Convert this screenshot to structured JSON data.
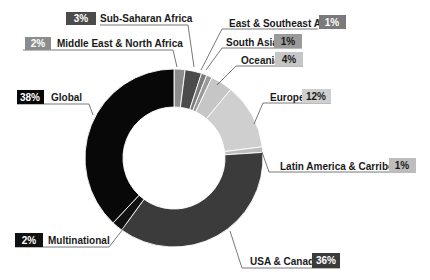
{
  "chart_data": {
    "type": "pie",
    "variant": "donut",
    "title": "",
    "start_angle": "12 o'clock, clockwise",
    "categories": [
      "Middle East & North Africa",
      "Sub-Saharan Africa",
      "East & Southeast Asia",
      "South Asia",
      "Oceania",
      "Europe",
      "Latin America & Carribean",
      "USA & Canada",
      "Multinational",
      "Global"
    ],
    "values": [
      2,
      3,
      1,
      1,
      4,
      12,
      1,
      36,
      2,
      38
    ],
    "colors": [
      "#8c8c8c",
      "#4b4b4b",
      "#7a7a7a",
      "#9a9a9a",
      "#c6c6c6",
      "#cfcfcf",
      "#bdbdbd",
      "#3b3b3b",
      "#111111",
      "#080808"
    ],
    "legend": "inline leader-line labels"
  },
  "labels": [
    {
      "name": "Middle East & North Africa",
      "pct": "2%"
    },
    {
      "name": "Sub-Saharan Africa",
      "pct": "3%"
    },
    {
      "name": "East & Southeast Asia",
      "pct": "1%"
    },
    {
      "name": "South Asia",
      "pct": "1%"
    },
    {
      "name": "Oceania",
      "pct": "4%"
    },
    {
      "name": "Europe",
      "pct": "12%"
    },
    {
      "name": "Latin America & Carribean",
      "pct": "1%"
    },
    {
      "name": "USA & Canada",
      "pct": "36%"
    },
    {
      "name": "Multinational",
      "pct": "2%"
    },
    {
      "name": "Global",
      "pct": "38%"
    }
  ]
}
